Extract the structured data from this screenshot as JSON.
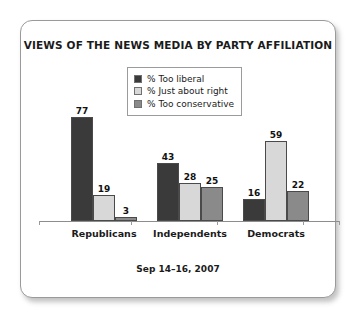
{
  "chart_data": {
    "type": "bar",
    "title": "VIEWS OF THE NEWS MEDIA BY PARTY AFFILIATION",
    "subtitle": "Sep 14–16, 2007",
    "xlabel": "",
    "ylabel": "",
    "ylim": [
      0,
      80
    ],
    "grid": false,
    "legend_position": "top-center",
    "categories": [
      "Republicans",
      "Independents",
      "Democrats"
    ],
    "series": [
      {
        "name": "% Too liberal",
        "color": "#3a3a3a",
        "values": [
          77,
          43,
          16
        ]
      },
      {
        "name": "% Just about right",
        "color": "#d8d8d8",
        "values": [
          19,
          28,
          59
        ]
      },
      {
        "name": "% Too conservative",
        "color": "#8a8a8a",
        "values": [
          3,
          25,
          22
        ]
      }
    ]
  },
  "card": {
    "border_color": "#9a9a9a"
  }
}
